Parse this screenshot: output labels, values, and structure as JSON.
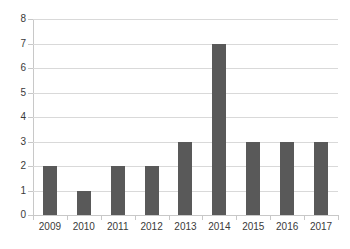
{
  "chart_data": {
    "type": "bar",
    "title": "",
    "subtitle": "",
    "xlabel": "",
    "ylabel": "",
    "categories": [
      "2009",
      "2010",
      "2011",
      "2012",
      "2013",
      "2014",
      "2015",
      "2016",
      "2017"
    ],
    "values": [
      2,
      1,
      2,
      2,
      3,
      7,
      3,
      3,
      3
    ],
    "ylim": [
      0,
      8
    ],
    "ytick_labels": [
      "0",
      "1",
      "2",
      "3",
      "4",
      "5",
      "6",
      "7",
      "8"
    ],
    "ytick_values": [
      0,
      1,
      2,
      3,
      4,
      5,
      6,
      7,
      8
    ],
    "grid": true,
    "grid_axis": "y",
    "legend": false,
    "legend_position": "none",
    "annotations": [],
    "colors": {
      "bar": "#595959",
      "gridline": "#d9d9d9",
      "axis": "#c8c8c8",
      "tick_label": "#3a3a3a",
      "background": "#ffffff"
    }
  }
}
